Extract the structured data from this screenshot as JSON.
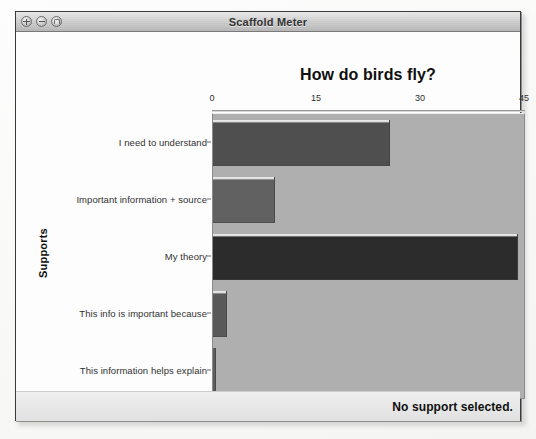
{
  "window": {
    "title": "Scaffold Meter",
    "controls": [
      {
        "name": "close",
        "glyph": "×"
      },
      {
        "name": "minimize",
        "glyph": "−"
      },
      {
        "name": "zoom",
        "glyph": "▢"
      }
    ]
  },
  "footer": {
    "status": "No support selected."
  },
  "chart_data": {
    "type": "bar",
    "orientation": "horizontal",
    "title": "How do birds fly?",
    "xlabel": "",
    "ylabel": "Supports",
    "xlim": [
      0,
      45
    ],
    "xticks": [
      0,
      15,
      30,
      45
    ],
    "xtick_labels": [
      "0",
      "15",
      "30",
      "45"
    ],
    "grid": false,
    "legend": null,
    "categories": [
      "I need to understand",
      "Important information + source",
      "My theory",
      "This info is important because",
      "This information helps explain"
    ],
    "values": [
      25.5,
      9,
      44,
      2,
      0.5
    ],
    "bar_colors": [
      "#4a4a4a",
      "#5d5d5d",
      "#242424",
      "#555555",
      "#5a5a5a"
    ],
    "plot_background": "#b2b2b2"
  }
}
